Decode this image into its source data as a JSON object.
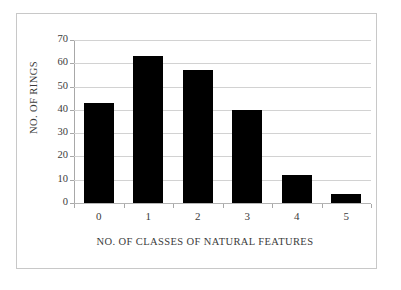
{
  "chart_data": {
    "type": "bar",
    "title": "",
    "categories": [
      "0",
      "1",
      "2",
      "3",
      "4",
      "5"
    ],
    "values": [
      43,
      63,
      57,
      40,
      12,
      4
    ],
    "xlabel": "NO. OF CLASSES OF NATURAL FEATURES",
    "ylabel": "NO. OF RINGS",
    "ylim": [
      0,
      70
    ],
    "yticks": [
      "0",
      "10",
      "20",
      "30",
      "40",
      "50",
      "60",
      "70"
    ],
    "ytick_values": [
      0,
      10,
      20,
      30,
      40,
      50,
      60,
      70
    ],
    "grid": "horizontal",
    "legend": "none",
    "bar_color": "#000000",
    "gridline_color": "#d2d2d2",
    "axis_color": "#a8a8a8",
    "background_color": "#ffffff",
    "frame_color": "#c8c8c8"
  }
}
